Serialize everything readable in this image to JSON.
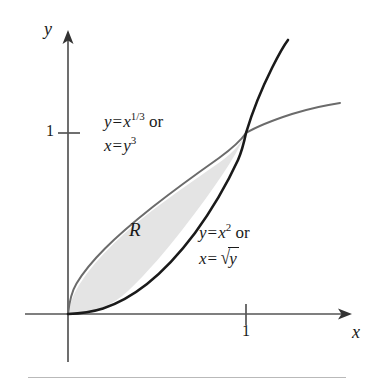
{
  "figure": {
    "type": "math-plot",
    "background_color": "#ffffff",
    "axes": {
      "x_axis_label": "x",
      "y_axis_label": "y",
      "x_tick_labels": [
        "1"
      ],
      "y_tick_labels": [
        "1"
      ],
      "x_origin_px": 68,
      "y_origin_px": 314,
      "x_unit_px": 178,
      "y_unit_px": 181,
      "axis_color": "#555555",
      "x_axis_start_px": 25,
      "x_axis_end_px": 350,
      "y_axis_top_px": 30,
      "y_axis_bottom_px": 362
    },
    "curves": [
      {
        "name": "cube-root-curve",
        "equation": "y = x^(1/3)",
        "color": "#6b6b6b",
        "width": 2.0,
        "x_range": [
          0,
          1.55
        ]
      },
      {
        "name": "parabola-curve",
        "equation": "y = x^2",
        "color": "#1a1a1a",
        "width": 2.6,
        "x_range": [
          0,
          1.24
        ]
      }
    ],
    "shaded_region": {
      "name": "region-R",
      "label": "R",
      "fill_color": "#e4e4e4",
      "bounded_by": [
        "y = x^(1/3)",
        "y = x^2"
      ],
      "x_range": [
        0,
        1
      ]
    },
    "intersection_points": [
      {
        "x": 0,
        "y": 0
      },
      {
        "x": 1,
        "y": 1
      }
    ],
    "annotations": {
      "upper_curve_label": {
        "line1_lhs": "y",
        "line1_eq": "=",
        "line1_base": "x",
        "line1_exp": "1/3",
        "line1_or": "or",
        "line2_lhs": "x",
        "line2_eq": "=",
        "line2_base": "y",
        "line2_exp": "3"
      },
      "lower_curve_label": {
        "line1_lhs": "y",
        "line1_eq": "=",
        "line1_base": "x",
        "line1_exp": "2",
        "line1_or": "or",
        "line2_lhs": "x",
        "line2_eq": "=",
        "line2_radical": "√",
        "line2_radicand": "y"
      }
    }
  }
}
